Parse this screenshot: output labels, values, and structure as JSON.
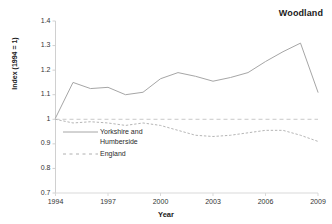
{
  "chart_data": {
    "type": "line",
    "title": "Woodland",
    "xlabel": "Year",
    "ylabel": "Index (1994 = 1)",
    "x": [
      1994,
      1995,
      1996,
      1997,
      1998,
      1999,
      2000,
      2001,
      2002,
      2003,
      2004,
      2005,
      2006,
      2007,
      2008,
      2009
    ],
    "xlim": [
      1994,
      2009
    ],
    "ylim": [
      0.7,
      1.4
    ],
    "yticks": [
      "0.7",
      "0.8",
      "0.9",
      "1",
      "1.1",
      "1.2",
      "1.3",
      "1.4"
    ],
    "ytick_values": [
      0.7,
      0.8,
      0.9,
      1.0,
      1.1,
      1.2,
      1.3,
      1.4
    ],
    "xticks": [
      "1994",
      "1997",
      "2000",
      "2003",
      "2006",
      "2009"
    ],
    "xtick_values": [
      1994,
      1997,
      2000,
      2003,
      2006,
      2009
    ],
    "grid": false,
    "reference_line": 1.0,
    "legend_position": "inside-left",
    "series": [
      {
        "name": "Yorkshire and Humberside",
        "style": "solid",
        "color": "#a6a6a6",
        "values": [
          1.005,
          1.15,
          1.125,
          1.13,
          1.1,
          1.11,
          1.165,
          1.19,
          1.175,
          1.155,
          1.17,
          1.19,
          1.235,
          1.275,
          1.31,
          1.11
        ]
      },
      {
        "name": "England",
        "style": "dotted",
        "color": "#b5b5b5",
        "values": [
          1.0,
          0.985,
          0.99,
          0.985,
          0.975,
          0.985,
          0.975,
          0.955,
          0.935,
          0.93,
          0.935,
          0.945,
          0.955,
          0.955,
          0.935,
          0.91
        ]
      }
    ]
  },
  "legend": {
    "series_1_label": "Yorkshire and\nHumberside",
    "series_2_label": "England"
  }
}
